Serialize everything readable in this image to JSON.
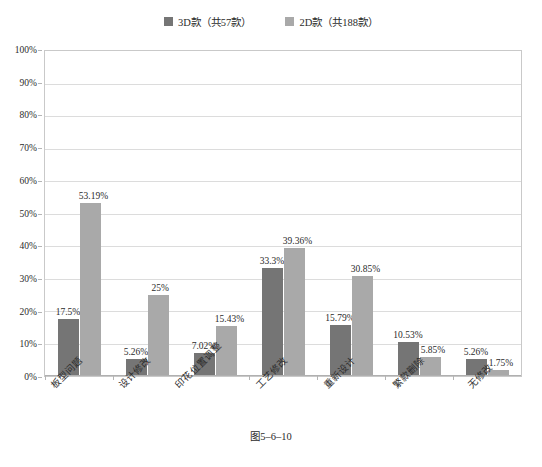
{
  "chart_data": {
    "type": "bar",
    "title": "",
    "xlabel": "",
    "ylabel": "",
    "ylim": [
      0,
      100
    ],
    "ytick_labels": [
      "100%",
      "90%",
      "80%",
      "70%",
      "60%",
      "50%",
      "40%",
      "30%",
      "20%",
      "10%",
      "0%"
    ],
    "ytick_values": [
      100,
      90,
      80,
      70,
      60,
      50,
      40,
      30,
      20,
      10,
      0
    ],
    "grid": true,
    "legend_position": "top-center",
    "categories": [
      "板型问题",
      "设计修改",
      "印花位置调整",
      "工艺修改",
      "重新设计",
      "繁款删除",
      "无修改"
    ],
    "series": [
      {
        "name": "3D款（共57款）",
        "color": "#757575",
        "values": [
          17.5,
          5.26,
          7.02,
          33.3,
          15.79,
          10.53,
          5.26
        ],
        "labels": [
          "17.5%",
          "5.26%",
          "7.02%",
          "33.3%",
          "15.79%",
          "10.53%",
          "5.26%"
        ]
      },
      {
        "name": "2D款（共188款）",
        "color": "#a9a9a9",
        "values": [
          53.19,
          25,
          15.43,
          39.36,
          30.85,
          5.85,
          1.75
        ],
        "labels": [
          "53.19%",
          "25%",
          "15.43%",
          "39.36%",
          "30.85%",
          "5.85%",
          "1.75%"
        ]
      }
    ]
  },
  "caption": {
    "text": "图5–6–10"
  },
  "colors": {
    "series_3d": "#757575",
    "series_2d": "#a9a9a9",
    "gridline": "#dcdcdc",
    "plot_border": "#c9c9c9",
    "background": "#ffffff"
  }
}
